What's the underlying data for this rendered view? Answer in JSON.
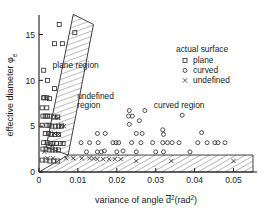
{
  "chart_data": {
    "type": "scatter",
    "title": "",
    "xlabel": "variance of angle  d̅²(rad²)",
    "ylabel": "effective diameter  φₑ",
    "xlim": [
      0,
      0.055
    ],
    "ylim": [
      0,
      16.8
    ],
    "grid": false,
    "xticks": [
      0,
      0.01,
      0.02,
      0.03,
      0.04,
      0.05
    ],
    "xticklabels": [
      "0",
      "0.01",
      "0.02",
      "0.03",
      "0.04",
      "0.05"
    ],
    "yticks": [
      0,
      5,
      10,
      15
    ],
    "yticklabels": [
      "0",
      "5",
      "10",
      "15"
    ],
    "legend": {
      "title": "actual surface",
      "position": "upper-right-inside",
      "entries": [
        {
          "label": "plane",
          "marker": "square"
        },
        {
          "label": "curved",
          "marker": "circle"
        },
        {
          "label": "undefined",
          "marker": "cross"
        }
      ]
    },
    "annotations": [
      {
        "text": "plane region",
        "x": 0.0035,
        "y": 11.3
      },
      {
        "text": "undefined",
        "x": 0.0098,
        "y": 8.0
      },
      {
        "text": "region",
        "x": 0.0098,
        "y": 7.0
      },
      {
        "text": "curved region",
        "x": 0.0295,
        "y": 7.0
      }
    ],
    "regions": [
      {
        "name": "undefined-band-diagonal",
        "hatch": true,
        "polygon": [
          [
            0.0018,
            2.7
          ],
          [
            0.0088,
            17.2
          ],
          [
            0.014,
            16.1
          ],
          [
            0.0075,
            1.85
          ]
        ]
      },
      {
        "name": "undefined-band-horizontal",
        "hatch": true,
        "polygon": [
          [
            0.0,
            0.0
          ],
          [
            0.0075,
            1.85
          ],
          [
            0.055,
            1.85
          ],
          [
            0.055,
            0.0
          ]
        ]
      }
    ],
    "series": [
      {
        "name": "plane",
        "marker": "square",
        "x": [
          0.0052,
          0.004,
          0.006,
          0.0092,
          0.0012,
          0.0022,
          0.004,
          0.0012,
          0.0013,
          0.002,
          0.0027,
          0.0008,
          0.002,
          0.001,
          0.0016,
          0.0022,
          0.0028,
          0.0038,
          0.0048,
          0.0008,
          0.002,
          0.0026,
          0.0033,
          0.0042,
          0.005,
          0.0058,
          0.0016,
          0.0024,
          0.0032,
          0.004,
          0.005,
          0.0012,
          0.0021,
          0.003,
          0.0036,
          0.0045,
          0.0055,
          0.0062,
          0.001,
          0.0018,
          0.0026,
          0.0034,
          0.0042,
          0.005,
          0.0008,
          0.0018,
          0.0028,
          0.0038,
          0.0048
        ],
        "y": [
          16.1,
          14.0,
          14.0,
          15.2,
          11.1,
          10.0,
          9.1,
          8.1,
          8.1,
          8.1,
          8.0,
          7.0,
          7.0,
          6.1,
          6.1,
          6.1,
          6.1,
          6.0,
          6.0,
          5.1,
          5.1,
          5.1,
          5.0,
          5.0,
          5.0,
          5.0,
          4.2,
          4.2,
          4.1,
          4.1,
          4.1,
          3.2,
          3.2,
          3.1,
          3.1,
          3.1,
          3.1,
          3.1,
          2.5,
          2.5,
          2.4,
          2.4,
          2.4,
          2.4,
          1.3,
          1.3,
          1.2,
          1.2,
          1.2
        ]
      },
      {
        "name": "curved",
        "marker": "circle",
        "x": [
          0.0232,
          0.0272,
          0.023,
          0.024,
          0.0258,
          0.0368,
          0.0232,
          0.0318,
          0.015,
          0.017,
          0.025,
          0.0265,
          0.032,
          0.0418,
          0.0108,
          0.013,
          0.0152,
          0.019,
          0.0198,
          0.0205,
          0.0238,
          0.0262,
          0.0292,
          0.0318,
          0.033,
          0.0342,
          0.036,
          0.0408,
          0.0432,
          0.0452,
          0.046,
          0.0478,
          0.0122,
          0.015,
          0.016,
          0.02,
          0.025,
          0.03,
          0.032,
          0.0388,
          0.0168,
          0.0216
        ],
        "y": [
          6.7,
          6.7,
          6.1,
          6.1,
          5.6,
          6.2,
          5.2,
          4.6,
          4.2,
          4.2,
          4.2,
          4.2,
          4.1,
          4.3,
          3.2,
          3.2,
          3.2,
          3.2,
          3.2,
          3.2,
          3.2,
          3.2,
          3.2,
          3.2,
          3.2,
          3.2,
          3.2,
          3.2,
          3.2,
          3.2,
          3.2,
          3.2,
          2.2,
          2.2,
          2.2,
          2.2,
          2.2,
          2.2,
          2.2,
          2.2,
          2.3,
          2.3
        ]
      },
      {
        "name": "undefined",
        "marker": "cross",
        "x": [
          0.0042,
          0.005,
          0.0058,
          0.0064,
          0.004,
          0.005,
          0.0026,
          0.0034,
          0.0014,
          0.007,
          0.0088,
          0.011,
          0.013,
          0.014,
          0.015,
          0.0165,
          0.018,
          0.0195,
          0.021,
          0.025,
          0.034,
          0.05,
          0.0022,
          0.0036
        ],
        "y": [
          6.0,
          5.9,
          5.1,
          5.0,
          4.2,
          4.1,
          3.0,
          2.9,
          2.2,
          1.5,
          1.5,
          1.5,
          1.5,
          1.5,
          1.4,
          1.4,
          1.4,
          1.4,
          1.4,
          1.2,
          1.2,
          1.2,
          1.5,
          1.5
        ]
      }
    ]
  },
  "axes": {
    "ylabel": "effective diameter  φₑ",
    "xlabel_pre": "variance of angle  ",
    "xlabel_sym": "d",
    "xlabel_sup": "2",
    "xlabel_post": "(rad",
    "xlabel_post2": ")"
  },
  "legend_box": {
    "title": "actual surface",
    "item_plane": "plane",
    "item_curved": "curved",
    "item_undefined": "undefined"
  },
  "labels": {
    "plane_region": "plane region",
    "undefined_line1": "undefined",
    "undefined_line2": "region",
    "curved_region": "curved region"
  }
}
